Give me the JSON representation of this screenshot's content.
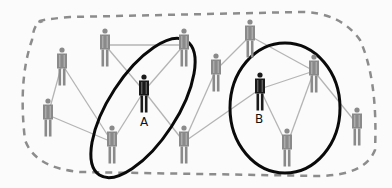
{
  "diagram": {
    "type": "social-network",
    "colors": {
      "background": "#fbfbfb",
      "edge": "#b4b4b4",
      "person_default": "#8a8a8a",
      "person_highlight": "#1a1a1a",
      "ellipse": "#0a0a0a",
      "boundary": "#8c8c8c"
    },
    "nodes": [
      {
        "id": "n1",
        "x": 62,
        "y": 50,
        "highlight": false,
        "label": ""
      },
      {
        "id": "n2",
        "x": 105,
        "y": 31,
        "highlight": false,
        "label": ""
      },
      {
        "id": "n3",
        "x": 184,
        "y": 31,
        "highlight": false,
        "label": ""
      },
      {
        "id": "n4",
        "x": 48,
        "y": 101,
        "highlight": false,
        "label": ""
      },
      {
        "id": "A",
        "x": 144,
        "y": 77,
        "highlight": true,
        "label": "A"
      },
      {
        "id": "n5",
        "x": 112,
        "y": 128,
        "highlight": false,
        "label": ""
      },
      {
        "id": "n6",
        "x": 184,
        "y": 128,
        "highlight": false,
        "label": ""
      },
      {
        "id": "n7",
        "x": 216,
        "y": 56,
        "highlight": false,
        "label": ""
      },
      {
        "id": "n8",
        "x": 250,
        "y": 22,
        "highlight": false,
        "label": ""
      },
      {
        "id": "B",
        "x": 260,
        "y": 75,
        "highlight": true,
        "label": "B"
      },
      {
        "id": "n9",
        "x": 314,
        "y": 57,
        "highlight": false,
        "label": ""
      },
      {
        "id": "n10",
        "x": 287,
        "y": 131,
        "highlight": false,
        "label": ""
      },
      {
        "id": "n11",
        "x": 357,
        "y": 110,
        "highlight": false,
        "label": ""
      }
    ],
    "edges": [
      [
        "n2",
        "n3"
      ],
      [
        "n2",
        "A"
      ],
      [
        "n3",
        "A"
      ],
      [
        "n1",
        "n4"
      ],
      [
        "n1",
        "n5"
      ],
      [
        "n4",
        "n5"
      ],
      [
        "A",
        "n5"
      ],
      [
        "A",
        "n6"
      ],
      [
        "n6",
        "n7"
      ],
      [
        "n6",
        "B"
      ],
      [
        "n7",
        "n8"
      ],
      [
        "n8",
        "n9"
      ],
      [
        "B",
        "n9"
      ],
      [
        "B",
        "n10"
      ],
      [
        "n9",
        "n10"
      ],
      [
        "n9",
        "n11"
      ]
    ],
    "labels": {
      "A": "A",
      "B": "B"
    },
    "groups": [
      {
        "name": "group-A",
        "cx": 143,
        "cy": 108,
        "rx": 34,
        "ry": 80,
        "rotate": 33
      },
      {
        "name": "group-B",
        "cx": 285,
        "cy": 108,
        "rx": 55,
        "ry": 65,
        "rotate": 0
      }
    ]
  }
}
